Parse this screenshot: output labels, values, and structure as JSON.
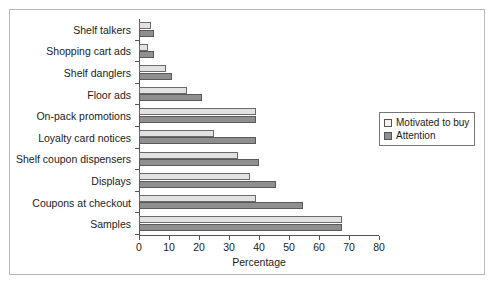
{
  "chart_data": {
    "type": "bar",
    "orientation": "horizontal",
    "title": "",
    "xlabel": "Percentage",
    "ylabel": "",
    "xlim": [
      0,
      80
    ],
    "xticks": [
      0,
      10,
      20,
      30,
      40,
      50,
      60,
      70,
      80
    ],
    "grid": false,
    "legend_position": "right",
    "categories": [
      "Shelf talkers",
      "Shopping cart ads",
      "Shelf danglers",
      "Floor ads",
      "On-pack promotions",
      "Loyalty card notices",
      "Shelf coupon dispensers",
      "Displays",
      "Coupons at checkout",
      "Samples"
    ],
    "series": [
      {
        "name": "Motivated to buy",
        "color": "#e2e2e2",
        "values": [
          4,
          3,
          9,
          16,
          39,
          25,
          33,
          37,
          39,
          68
        ]
      },
      {
        "name": "Attention",
        "color": "#8f8f8f",
        "values": [
          5,
          5,
          11,
          21,
          39,
          39,
          40,
          46,
          55,
          68
        ]
      }
    ]
  },
  "figure": {
    "ghost_text": "Retailers' views on in-store media"
  }
}
